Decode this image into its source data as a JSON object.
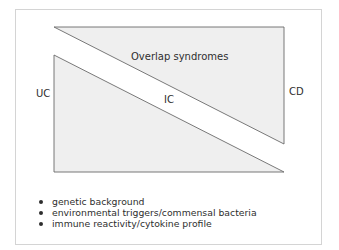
{
  "diagram": {
    "labels": {
      "left": "UC",
      "right": "CD",
      "middle": "IC",
      "upper": "Overlap syndromes"
    },
    "shapes": {
      "upper_triangle": {
        "points": "54,27 284,27 284,144",
        "fill": "#efefef",
        "stroke": "#6a6a6a"
      },
      "lower_triangle": {
        "points": "54,55 54,172 284,172",
        "fill": "#efefef",
        "stroke": "#6a6a6a"
      }
    },
    "factors": [
      "genetic background",
      "environmental triggers/commensal bacteria",
      "immune reactivity/cytokine profile"
    ]
  }
}
